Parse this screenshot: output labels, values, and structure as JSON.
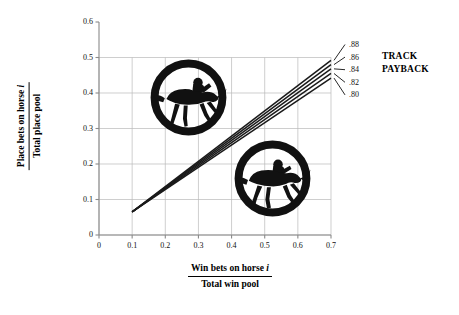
{
  "chart_data": {
    "type": "line",
    "title": "",
    "xlabel_numerator": "Win bets on horse i",
    "xlabel_denominator": "Total win pool",
    "ylabel_numerator": "Place bets on horse i",
    "ylabel_denominator": "Total place pool",
    "xlim": [
      0,
      0.7
    ],
    "ylim": [
      0,
      0.6
    ],
    "xticks": [
      "0",
      "0.1",
      "0.2",
      "0.3",
      "0.4",
      "0.5",
      "0.6",
      "0.7"
    ],
    "xtick_values": [
      0,
      0.1,
      0.2,
      0.3,
      0.4,
      0.5,
      0.6,
      0.7
    ],
    "yticks": [
      "0",
      "0.1",
      "0.2",
      "0.3",
      "0.4",
      "0.5",
      "0.6"
    ],
    "ytick_values": [
      0,
      0.1,
      0.2,
      0.3,
      0.4,
      0.5,
      0.6
    ],
    "grid": true,
    "grid_y_max": 0.5,
    "legend_position": "right",
    "legend_title": "TRACK PAYBACK",
    "series": [
      {
        "name": ".88",
        "x": [
          0.1,
          0.7
        ],
        "y": [
          0.065,
          0.492
        ],
        "color": "#1a1a1a"
      },
      {
        "name": ".86",
        "x": [
          0.1,
          0.7
        ],
        "y": [
          0.065,
          0.48
        ],
        "color": "#1a1a1a"
      },
      {
        "name": ".84",
        "x": [
          0.1,
          0.7
        ],
        "y": [
          0.065,
          0.468
        ],
        "color": "#1a1a1a"
      },
      {
        "name": ".82",
        "x": [
          0.1,
          0.7
        ],
        "y": [
          0.065,
          0.455
        ],
        "color": "#1a1a1a"
      },
      {
        "name": ".80",
        "x": [
          0.1,
          0.7
        ],
        "y": [
          0.065,
          0.442
        ],
        "color": "#1a1a1a"
      }
    ]
  },
  "axes": {
    "y_title_numerator": "Place bets on horse i",
    "y_title_denominator": "Total place pool",
    "x_title_numerator": "Win bets on horse i",
    "x_title_denominator": "Total win pool"
  },
  "legend": {
    "title_line1": "TRACK",
    "title_line2": "PAYBACK",
    "labels": [
      ".88",
      ".86",
      ".84",
      ".82",
      ".80"
    ]
  },
  "decorations": {
    "badge_top": "horse-jockey-badge-icon",
    "badge_bottom": "horse-jockey-badge-icon"
  },
  "colors": {
    "line": "#1a1a1a",
    "grid": "#b9b9b9",
    "axis": "#8a8a8a",
    "text": "#111111",
    "background": "#ffffff"
  }
}
